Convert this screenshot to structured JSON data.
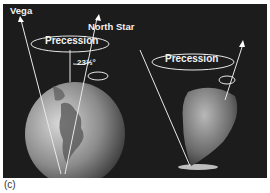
{
  "figure": {
    "caption": "(c)",
    "left_panel": {
      "star_left": "Vega",
      "star_right": "North Star",
      "motion_label": "Precession",
      "tilt_angle": "23½°"
    },
    "right_panel": {
      "motion_label": "Precession"
    },
    "colors": {
      "background": "#1c1c1c",
      "lines": "#e8e8e8",
      "text": "#f2f2f2"
    }
  }
}
